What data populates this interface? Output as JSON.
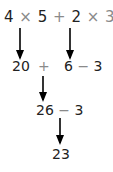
{
  "steps": {
    "line1": {
      "a": "4",
      "op1": "×",
      "b": "5",
      "op2": "+",
      "c": "2",
      "op3": "×",
      "d": "3",
      "op4": "−",
      "e": "3"
    },
    "line2": {
      "a": "20",
      "op1": "+",
      "b": "6",
      "op2": "−",
      "c": "3"
    },
    "line3": {
      "a": "26",
      "op1": "−",
      "b": "3"
    },
    "line4": {
      "result": "23"
    }
  },
  "colors": {
    "text": "#222222",
    "operator": "#8a8a8a",
    "arrow": "#000000"
  }
}
